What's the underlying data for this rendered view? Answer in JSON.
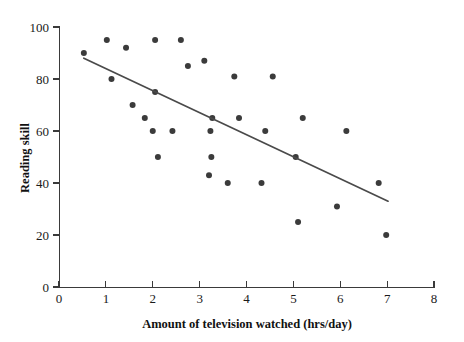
{
  "chart_data": {
    "type": "scatter",
    "title": "",
    "xlabel": "Amount of television watched (hrs/day)",
    "ylabel": "Reading skill",
    "xlim": [
      0,
      8
    ],
    "ylim": [
      0,
      100
    ],
    "xticks": [
      0,
      1,
      2,
      3,
      4,
      5,
      6,
      7,
      8
    ],
    "yticks": [
      0,
      20,
      40,
      60,
      80,
      100
    ],
    "xtick_labels": [
      "0",
      "1",
      "2",
      "3",
      "4",
      "5",
      "6",
      "7",
      "8"
    ],
    "ytick_labels": [
      "0",
      "20",
      "40",
      "60",
      "80",
      "100"
    ],
    "grid": false,
    "legend": null,
    "marker_color": "#3b3b3b",
    "marker_size": 3,
    "points": [
      {
        "x": 0.53,
        "y": 90
      },
      {
        "x": 1.02,
        "y": 95
      },
      {
        "x": 1.12,
        "y": 80
      },
      {
        "x": 1.43,
        "y": 92
      },
      {
        "x": 1.57,
        "y": 70
      },
      {
        "x": 1.83,
        "y": 65
      },
      {
        "x": 2.0,
        "y": 60
      },
      {
        "x": 2.05,
        "y": 95
      },
      {
        "x": 2.05,
        "y": 75
      },
      {
        "x": 2.11,
        "y": 50
      },
      {
        "x": 2.42,
        "y": 60
      },
      {
        "x": 2.6,
        "y": 95
      },
      {
        "x": 2.75,
        "y": 85
      },
      {
        "x": 3.1,
        "y": 87
      },
      {
        "x": 3.2,
        "y": 43
      },
      {
        "x": 3.23,
        "y": 60
      },
      {
        "x": 3.25,
        "y": 50
      },
      {
        "x": 3.27,
        "y": 65
      },
      {
        "x": 3.6,
        "y": 40
      },
      {
        "x": 3.74,
        "y": 81
      },
      {
        "x": 3.84,
        "y": 65
      },
      {
        "x": 4.32,
        "y": 40
      },
      {
        "x": 4.4,
        "y": 60
      },
      {
        "x": 4.56,
        "y": 81
      },
      {
        "x": 5.05,
        "y": 50
      },
      {
        "x": 5.1,
        "y": 25
      },
      {
        "x": 5.2,
        "y": 65
      },
      {
        "x": 5.93,
        "y": 31
      },
      {
        "x": 6.13,
        "y": 60
      },
      {
        "x": 6.82,
        "y": 40
      },
      {
        "x": 6.98,
        "y": 20
      }
    ],
    "trend_line": {
      "x_start": 0.53,
      "y_start": 88,
      "x_end": 7.02,
      "y_end": 33,
      "color": "#4a4a4a"
    }
  }
}
